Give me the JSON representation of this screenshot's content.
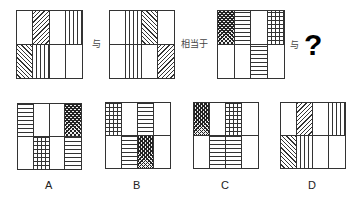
{
  "question": {
    "connector_1": "与",
    "equivalence": "相当于",
    "connector_2": "与",
    "unknown": "?"
  },
  "figures": {
    "given_1": {
      "top": [
        "empty",
        "fwd",
        "empty",
        "vert"
      ],
      "bottom": [
        "back",
        "vert",
        "empty",
        "empty"
      ]
    },
    "given_2": {
      "top": [
        "empty",
        "vert",
        "back",
        "empty"
      ],
      "bottom": [
        "empty",
        "vert",
        "empty",
        "fwd"
      ]
    },
    "given_3": {
      "top": [
        "diamond",
        "horiz",
        "empty",
        "grid"
      ],
      "bottom": [
        "empty",
        "empty",
        "horiz",
        "empty"
      ]
    }
  },
  "options": [
    {
      "label": "A",
      "top": [
        "horiz",
        "empty",
        "empty",
        "diamond"
      ],
      "bottom": [
        "empty",
        "grid",
        "empty",
        "horiz"
      ]
    },
    {
      "label": "B",
      "top": [
        "grid",
        "empty",
        "horiz",
        "empty"
      ],
      "bottom": [
        "empty",
        "horiz",
        "diamond",
        "empty"
      ]
    },
    {
      "label": "C",
      "top": [
        "diamond",
        "empty",
        "grid",
        "empty"
      ],
      "bottom": [
        "empty",
        "horiz",
        "horiz",
        "empty"
      ]
    },
    {
      "label": "D",
      "top": [
        "empty",
        "fwd",
        "empty",
        "vert"
      ],
      "bottom": [
        "back",
        "vert",
        "empty",
        "empty"
      ]
    }
  ],
  "pattern_legend": {
    "empty": "blank",
    "vert": "vertical lines",
    "horiz": "horizontal lines",
    "grid": "square grid",
    "fwd": "diagonal lines /",
    "back": "diagonal lines \\",
    "diamond": "dense crosshatch"
  }
}
